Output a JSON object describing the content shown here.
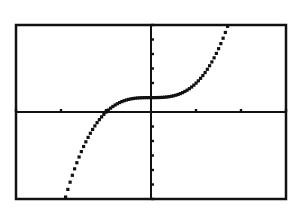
{
  "chart_data": {
    "type": "line",
    "title": "",
    "xlabel": "",
    "ylabel": "",
    "function": "y = x^3 + 1",
    "xlim": [
      -3,
      3
    ],
    "ylim": [
      -6,
      6
    ],
    "x_ticks": [
      -3,
      -2,
      -1,
      0,
      1,
      2,
      3
    ],
    "y_ticks": [
      -6,
      -5,
      -4,
      -3,
      -2,
      -1,
      0,
      1,
      2,
      3,
      4,
      5,
      6
    ],
    "grid": false,
    "legend": "none",
    "series": [
      {
        "name": "f(x)",
        "x": [
          -1.9,
          -1.75,
          -1.5,
          -1.25,
          -1.0,
          -0.75,
          -0.5,
          -0.25,
          0,
          0.25,
          0.5,
          0.75,
          1.0,
          1.25,
          1.5,
          1.71
        ],
        "values": [
          -5.86,
          -4.36,
          -2.38,
          -0.95,
          0.0,
          0.58,
          0.88,
          0.98,
          1.0,
          1.02,
          1.13,
          1.42,
          2.0,
          2.95,
          4.38,
          6.0
        ]
      }
    ],
    "style": {
      "line": "dotted-pixel",
      "color": "#111111",
      "frame_color": "#111111",
      "background": "#ffffff"
    }
  },
  "screen": {
    "frame": {
      "left": 16,
      "top": 25,
      "right": 286,
      "bottom": 199
    }
  }
}
